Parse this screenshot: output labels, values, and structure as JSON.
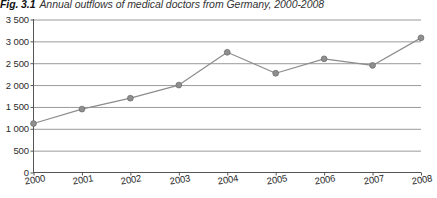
{
  "figure": {
    "number": "Fig. 3.1",
    "caption": "Annual outflows of medical doctors from Germany, 2000-2008"
  },
  "colors": {
    "series_line": "#8c8c8c",
    "marker_fill": "#8f8f8f",
    "marker_stroke": "#6e6e6e",
    "gridline": "#9a9a9a",
    "axis": "#555555",
    "text": "#2b2b2b"
  },
  "chart_data": {
    "type": "line",
    "title": "Annual outflows of medical doctors from Germany, 2000-2008",
    "xlabel": "",
    "ylabel": "",
    "categories": [
      "2000",
      "2001",
      "2002",
      "2003",
      "2004",
      "2005",
      "2006",
      "2007",
      "2008"
    ],
    "x": [
      2000,
      2001,
      2002,
      2003,
      2004,
      2005,
      2006,
      2007,
      2008
    ],
    "values": [
      1120,
      1450,
      1700,
      2000,
      2750,
      2270,
      2600,
      2450,
      3080
    ],
    "series": [
      {
        "name": "Annual outflows of medical doctors",
        "values": [
          1120,
          1450,
          1700,
          2000,
          2750,
          2270,
          2600,
          2450,
          3080
        ]
      }
    ],
    "ylim": [
      0,
      3500
    ],
    "ytick_values": [
      0,
      500,
      1000,
      1500,
      2000,
      2500,
      3000,
      3500
    ],
    "ytick_labels": [
      "0",
      "500",
      "1 000",
      "1 500",
      "2 000",
      "2 500",
      "3 000",
      "3 500"
    ],
    "xtick_labels": [
      "2000",
      "2001",
      "2002",
      "2003",
      "2004",
      "2005",
      "2006",
      "2007",
      "2008"
    ],
    "grid": "horizontal",
    "legend": "none",
    "marker": "circle"
  }
}
